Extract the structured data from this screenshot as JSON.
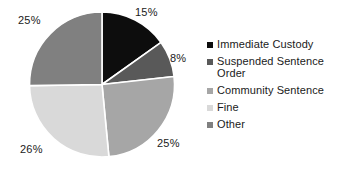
{
  "chart_data": {
    "type": "pie",
    "title": "",
    "categories": [
      "Immediate Custody",
      "Suspended Sentence Order",
      "Community Sentence",
      "Fine",
      "Other"
    ],
    "values": [
      15,
      8,
      25,
      26,
      25
    ],
    "value_labels": [
      "15%",
      "8%",
      "25%",
      "26%",
      "25%"
    ],
    "unit": "%",
    "colors": [
      "#0d0d0d",
      "#595959",
      "#a6a6a6",
      "#d9d9d9",
      "#808080"
    ],
    "legend_position": "right",
    "grid": false,
    "slice_separator_color": "#ffffff",
    "start_angle_deg": 0,
    "direction": "clockwise"
  },
  "legend": {
    "items": [
      {
        "label": "Immediate Custody",
        "color": "#0d0d0d",
        "marker": "square-swatch-icon"
      },
      {
        "label": "Suspended Sentence Order",
        "color": "#595959",
        "marker": "square-swatch-icon"
      },
      {
        "label": "Community Sentence",
        "color": "#a6a6a6",
        "marker": "square-swatch-icon"
      },
      {
        "label": "Fine",
        "color": "#d9d9d9",
        "marker": "square-swatch-icon"
      },
      {
        "label": "Other",
        "color": "#808080",
        "marker": "square-swatch-icon"
      }
    ]
  },
  "labels": {
    "immediate_custody_pct": "15%",
    "suspended_sentence_order_pct": "8%",
    "community_sentence_pct": "25%",
    "fine_pct": "26%",
    "other_pct": "25%"
  }
}
